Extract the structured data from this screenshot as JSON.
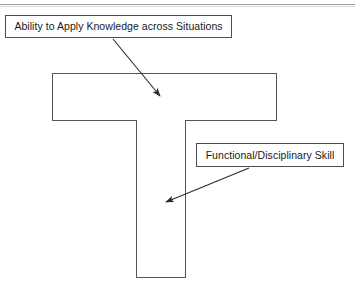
{
  "diagram": {
    "shapes": {
      "horizontal_bar": {
        "name": "t-bar",
        "label": "",
        "x": 52,
        "y": 73,
        "width": 225,
        "height": 48
      },
      "vertical_stem": {
        "name": "t-stem",
        "label": "",
        "x": 136,
        "y": 120,
        "width": 50,
        "height": 158
      }
    },
    "callouts": [
      {
        "id": "knowledge",
        "text": "Ability to Apply Knowledge across Situations",
        "x": 5,
        "y": 15,
        "width": 227,
        "height": 23,
        "arrow": {
          "from_x": 113,
          "from_y": 39,
          "to_x": 162,
          "to_y": 98
        },
        "points_to": "horizontal-bar"
      },
      {
        "id": "skill",
        "text": "Functional/Disciplinary Skill",
        "x": 196,
        "y": 143,
        "width": 148,
        "height": 24,
        "arrow": {
          "from_x": 249,
          "from_y": 168,
          "to_x": 163,
          "to_y": 203
        },
        "points_to": "vertical-stem"
      }
    ],
    "colors": {
      "background": "#ffffff",
      "shape_border": "#555555",
      "callout_border": "#4d4d4d",
      "text": "#1a1a1a",
      "arrow": "#2b2b2b",
      "top_rule": "#9a9a9a"
    }
  }
}
